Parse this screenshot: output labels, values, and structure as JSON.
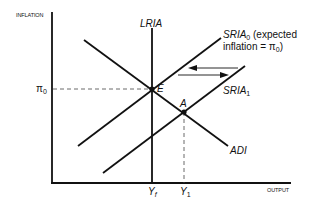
{
  "diagram": {
    "type": "economics AD-AS (ADI / SRIA / LRIA) diagram",
    "axes": {
      "y_label": "INFLATION",
      "x_label": "OUTPUT"
    },
    "curves": {
      "lria": {
        "label": "LRIA"
      },
      "adi": {
        "label": "ADI"
      },
      "sria0": {
        "label": "SRIA",
        "sub": "0",
        "note_line1": "(expected",
        "note_line2_pre": "inflation = π",
        "note_line2_sub": "0",
        "note_line2_post": ")"
      },
      "sria1": {
        "label": "SRIA",
        "sub": "1"
      }
    },
    "points": {
      "e": {
        "label": "E"
      },
      "a": {
        "label": "A"
      }
    },
    "ticks": {
      "pi0": {
        "label": "π",
        "sub": "0"
      },
      "yf": {
        "label": "Y",
        "sub": "f"
      },
      "y1": {
        "label": "Y",
        "sub": "1"
      }
    },
    "colors": {
      "line": "#111111",
      "background": "#ffffff"
    }
  }
}
